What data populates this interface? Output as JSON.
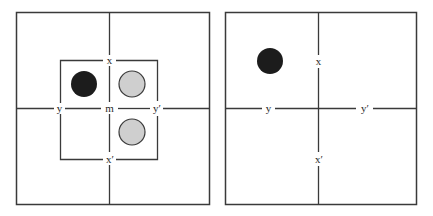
{
  "colors": {
    "line": "#3a3a3a",
    "black_disk": "#1c1c1c",
    "gray_disk_fill": "#cfcfcf",
    "gray_disk_stroke": "#3a3a3a",
    "background": "#ffffff"
  },
  "panels": [
    {
      "id": "left",
      "labels": {
        "top": "x",
        "bottom": "x′",
        "left": "y",
        "right": "y′",
        "center": "m"
      },
      "disks": [
        {
          "color": "black",
          "position": "upper-left"
        },
        {
          "color": "gray",
          "position": "upper-right"
        },
        {
          "color": "gray",
          "position": "lower-right"
        }
      ]
    },
    {
      "id": "right",
      "labels": {
        "top": "x",
        "bottom": "x′",
        "left": "y",
        "right": "y′"
      },
      "disks": [
        {
          "color": "black",
          "position": "upper-left"
        }
      ]
    }
  ]
}
